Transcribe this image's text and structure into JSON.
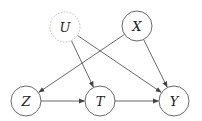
{
  "diagram": {
    "type": "causal-dag",
    "nodes": [
      {
        "id": "U",
        "label": "U",
        "x": 65,
        "y": 27,
        "style": "dashed"
      },
      {
        "id": "X",
        "label": "X",
        "x": 137,
        "y": 26,
        "style": "solid"
      },
      {
        "id": "Z",
        "label": "Z",
        "x": 26,
        "y": 101,
        "style": "solid"
      },
      {
        "id": "T",
        "label": "T",
        "x": 100,
        "y": 101,
        "style": "solid"
      },
      {
        "id": "Y",
        "label": "Y",
        "x": 174,
        "y": 101,
        "style": "solid"
      }
    ],
    "edges": [
      {
        "from": "U",
        "to": "T"
      },
      {
        "from": "U",
        "to": "Y"
      },
      {
        "from": "X",
        "to": "Z"
      },
      {
        "from": "X",
        "to": "Y"
      },
      {
        "from": "Z",
        "to": "T"
      },
      {
        "from": "T",
        "to": "Y"
      }
    ],
    "colors": {
      "stroke": "#444444",
      "dashed_stroke": "#bbbbbb",
      "text": "#222222"
    }
  }
}
